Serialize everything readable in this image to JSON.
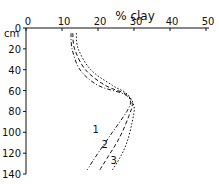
{
  "chart_data": {
    "type": "line",
    "title": "% clay",
    "xlabel": "% clay",
    "ylabel": "cm",
    "xlim": [
      0,
      50
    ],
    "ylim": [
      0,
      140
    ],
    "y_inverted": true,
    "x_axis_position": "top",
    "x_ticks": [
      0,
      10,
      20,
      30,
      40,
      50
    ],
    "y_ticks": [
      0,
      20,
      40,
      60,
      80,
      100,
      120,
      140
    ],
    "grid": false,
    "series": [
      {
        "name": "1",
        "line_style": "dash-dot",
        "points": [
          [
            12.5,
            5
          ],
          [
            12.8,
            20
          ],
          [
            15,
            40
          ],
          [
            20,
            55
          ],
          [
            27,
            63
          ],
          [
            29,
            70
          ],
          [
            28,
            80
          ],
          [
            24,
            100
          ],
          [
            20,
            120
          ],
          [
            17,
            136
          ]
        ]
      },
      {
        "name": "2",
        "line_style": "dashed",
        "points": [
          [
            13,
            5
          ],
          [
            13.5,
            20
          ],
          [
            16.5,
            40
          ],
          [
            22,
            55
          ],
          [
            27.5,
            63
          ],
          [
            29.5,
            72
          ],
          [
            28.5,
            85
          ],
          [
            26,
            105
          ],
          [
            22.5,
            125
          ],
          [
            20.5,
            136
          ]
        ]
      },
      {
        "name": "3",
        "line_style": "dotted",
        "points": [
          [
            14,
            5
          ],
          [
            14.5,
            20
          ],
          [
            18,
            40
          ],
          [
            24,
            55
          ],
          [
            28,
            63
          ],
          [
            30,
            75
          ],
          [
            29.5,
            90
          ],
          [
            28,
            110
          ],
          [
            26,
            125
          ],
          [
            24,
            136
          ]
        ]
      }
    ],
    "annotations": [
      {
        "text": "1",
        "x": 18.5,
        "y": 101
      },
      {
        "text": "2",
        "x": 21,
        "y": 115
      },
      {
        "text": "3",
        "x": 23.5,
        "y": 130
      }
    ]
  },
  "labels": {
    "title": "% clay",
    "y_unit": "cm"
  }
}
